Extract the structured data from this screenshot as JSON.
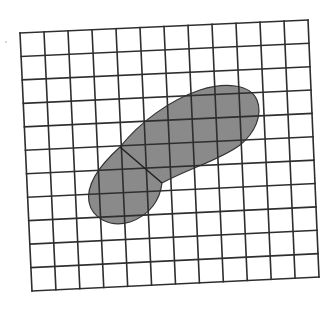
{
  "figure": {
    "grid": {
      "columns": 12,
      "rows": 11,
      "corners": {
        "top_left": [
          20,
          33
        ],
        "top_right": [
          308,
          20
        ],
        "bottom_right": [
          319,
          277
        ],
        "bottom_left": [
          32,
          291
        ]
      },
      "line_color": "#2e2e2e",
      "background_color": "#ffffff"
    },
    "shape": {
      "fill_color": "#8a8a8a",
      "outline_color": "#333333",
      "divider": {
        "from": [
          120,
          147
        ],
        "to": [
          162,
          183
        ]
      }
    }
  }
}
